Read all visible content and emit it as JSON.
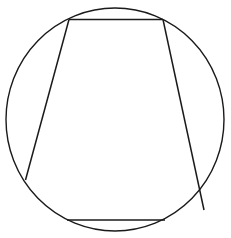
{
  "figure": {
    "width": 231,
    "height": 238,
    "stroke_color": "#1a1a1a",
    "background": "#ffffff",
    "circle": {
      "cx": 115,
      "cy": 119.5,
      "rx": 109,
      "ry": 111.5
    },
    "chords": [
      {
        "name": "top-chord",
        "x1": 69,
        "y1": 19.5,
        "x2": 163,
        "y2": 19.5
      },
      {
        "name": "left-chord",
        "x1": 69,
        "y1": 19.5,
        "x2": 25.5,
        "y2": 180
      },
      {
        "name": "right-chord",
        "x1": 163,
        "y1": 19.5,
        "x2": 204,
        "y2": 210
      },
      {
        "name": "bottom-chord",
        "x1": 67,
        "y1": 220,
        "x2": 165,
        "y2": 220
      }
    ]
  }
}
